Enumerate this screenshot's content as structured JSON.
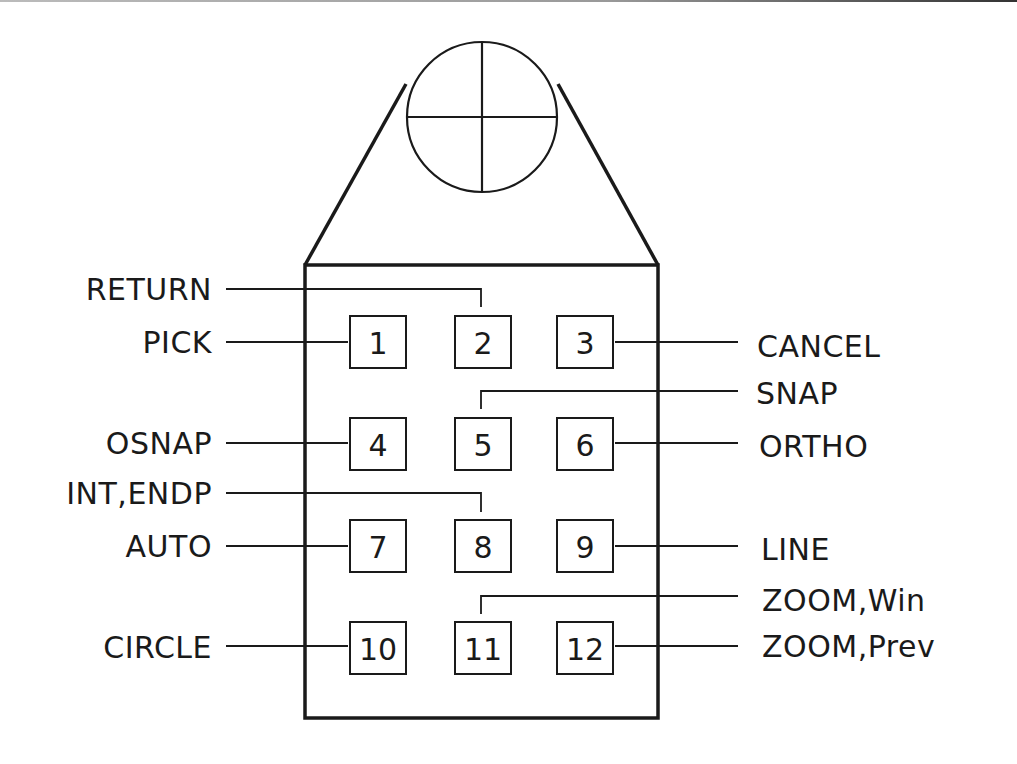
{
  "diagram": {
    "colors": {
      "ink": "#1a1a1a",
      "background": "#ffffff"
    },
    "crosshair": {
      "cx": 482,
      "cy": 117,
      "r": 75
    },
    "body": {
      "x": 305,
      "y": 265,
      "width": 353,
      "height": 453
    },
    "buttons": [
      {
        "id": 1,
        "label": "1",
        "x": 350,
        "y": 316,
        "w": 56,
        "h": 52
      },
      {
        "id": 2,
        "label": "2",
        "x": 455,
        "y": 316,
        "w": 56,
        "h": 52
      },
      {
        "id": 3,
        "label": "3",
        "x": 557,
        "y": 316,
        "w": 56,
        "h": 52
      },
      {
        "id": 4,
        "label": "4",
        "x": 350,
        "y": 418,
        "w": 56,
        "h": 52
      },
      {
        "id": 5,
        "label": "5",
        "x": 455,
        "y": 418,
        "w": 56,
        "h": 52
      },
      {
        "id": 6,
        "label": "6",
        "x": 557,
        "y": 418,
        "w": 56,
        "h": 52
      },
      {
        "id": 7,
        "label": "7",
        "x": 350,
        "y": 520,
        "w": 56,
        "h": 52
      },
      {
        "id": 8,
        "label": "8",
        "x": 455,
        "y": 520,
        "w": 56,
        "h": 52
      },
      {
        "id": 9,
        "label": "9",
        "x": 557,
        "y": 520,
        "w": 56,
        "h": 52
      },
      {
        "id": 10,
        "label": "10",
        "x": 350,
        "y": 622,
        "w": 56,
        "h": 52
      },
      {
        "id": 11,
        "label": "11",
        "x": 455,
        "y": 622,
        "w": 56,
        "h": 52
      },
      {
        "id": 12,
        "label": "12",
        "x": 557,
        "y": 622,
        "w": 56,
        "h": 52
      }
    ],
    "labels": {
      "return": "RETURN",
      "pick": "PICK",
      "cancel": "CANCEL",
      "snap": "SNAP",
      "osnap": "OSNAP",
      "ortho": "ORTHO",
      "int_endp": "INT,ENDP",
      "auto": "AUTO",
      "line": "LINE",
      "zoom_win": "ZOOM,Win",
      "circle": "CIRCLE",
      "zoom_prev": "ZOOM,Prev"
    },
    "assignments": [
      {
        "button": 1,
        "command": "PICK"
      },
      {
        "button": 2,
        "command": "RETURN"
      },
      {
        "button": 3,
        "command": "CANCEL"
      },
      {
        "button": 4,
        "command": "OSNAP"
      },
      {
        "button": 5,
        "command": "SNAP"
      },
      {
        "button": 6,
        "command": "ORTHO"
      },
      {
        "button": 7,
        "command": "AUTO"
      },
      {
        "button": 8,
        "command": "INT,ENDP"
      },
      {
        "button": 9,
        "command": "LINE"
      },
      {
        "button": 10,
        "command": "CIRCLE"
      },
      {
        "button": 11,
        "command": "ZOOM,Win"
      },
      {
        "button": 12,
        "command": "ZOOM,Prev"
      }
    ]
  }
}
